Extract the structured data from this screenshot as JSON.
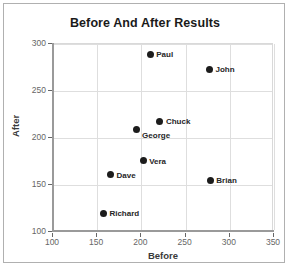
{
  "chart_data": {
    "type": "scatter",
    "title": "Before And After Results",
    "xlabel": "Before",
    "ylabel": "After",
    "xlim": [
      100,
      350
    ],
    "ylim": [
      100,
      300
    ],
    "xticks": [
      100,
      150,
      200,
      250,
      300,
      350
    ],
    "yticks": [
      100,
      150,
      200,
      250,
      300
    ],
    "grid": true,
    "legend": "none",
    "marker_color": "#1c1c1c",
    "points": [
      {
        "label": "Paul",
        "x": 210,
        "y": 289,
        "label_side": "right"
      },
      {
        "label": "John",
        "x": 277,
        "y": 273,
        "label_side": "right"
      },
      {
        "label": "Chuck",
        "x": 221,
        "y": 218,
        "label_side": "right"
      },
      {
        "label": "George",
        "x": 194,
        "y": 209,
        "label_side": "right-below"
      },
      {
        "label": "Vera",
        "x": 202,
        "y": 176,
        "label_side": "right"
      },
      {
        "label": "Dave",
        "x": 165,
        "y": 161,
        "label_side": "right"
      },
      {
        "label": "Brian",
        "x": 278,
        "y": 155,
        "label_side": "right"
      },
      {
        "label": "Richard",
        "x": 157,
        "y": 120,
        "label_side": "right"
      }
    ]
  },
  "colors": {
    "frame_border": "#b0b0b0",
    "gridline": "#dedede",
    "axis_line": "#9a9a9a",
    "tick_text": "#666666",
    "title_text": "#1a1a1a",
    "axis_title_text": "#3a3a3a"
  }
}
